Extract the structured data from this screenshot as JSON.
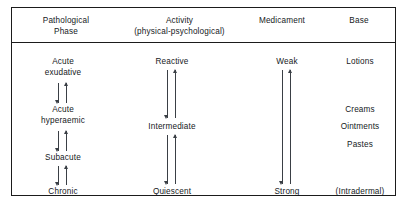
{
  "figure": {
    "frame_color": "#1b1b1b",
    "text_color": "#15191c",
    "arrow_color": "#3a3f45",
    "background": "#ffffff"
  },
  "headers": [
    {
      "line1": "Pathological",
      "line2": "Phase"
    },
    {
      "line1": "Activity",
      "line2": "(physical-psychological)"
    },
    {
      "line1": "Medicament",
      "line2": ""
    },
    {
      "line1": "Base",
      "line2": ""
    }
  ],
  "columns": {
    "pathological_phase": {
      "items": [
        {
          "line1": "Acute",
          "line2": "exudative"
        },
        {
          "line1": "Acute",
          "line2": "hyperaemic"
        },
        {
          "line1": "Subacute",
          "line2": ""
        },
        {
          "line1": "Chronic",
          "line2": ""
        }
      ]
    },
    "activity": {
      "items": [
        {
          "line1": "Reactive",
          "line2": ""
        },
        {
          "line1": "Intermediate",
          "line2": ""
        },
        {
          "line1": "Quiescent",
          "line2": ""
        }
      ]
    },
    "medicament": {
      "items": [
        {
          "line1": "Weak",
          "line2": ""
        },
        {
          "line1": "Strong",
          "line2": ""
        }
      ]
    },
    "base": {
      "items": [
        {
          "line1": "Lotions",
          "line2": ""
        },
        {
          "line1": "Creams",
          "line2": ""
        },
        {
          "line1": "Ointments",
          "line2": ""
        },
        {
          "line1": "Pastes",
          "line2": ""
        },
        {
          "line1": "(Intradermal)",
          "line2": ""
        }
      ]
    }
  }
}
